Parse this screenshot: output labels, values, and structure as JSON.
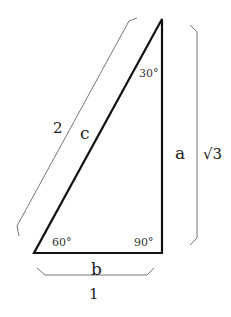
{
  "diagram": {
    "vertices": {
      "top": {
        "x": 162,
        "y": 19
      },
      "bottom_left": {
        "x": 34,
        "y": 253
      },
      "bottom_right": {
        "x": 162,
        "y": 253
      }
    },
    "sides": {
      "hypotenuse": {
        "label": "c",
        "length": "2"
      },
      "vertical": {
        "label": "a",
        "length": "√3"
      },
      "base": {
        "label": "b",
        "length": "1"
      }
    },
    "angles": {
      "top": "30°",
      "bottom_left": "60°",
      "bottom_right": "90°"
    },
    "colors": {
      "triangle_stroke": "#111111",
      "bracket_stroke": "#777777"
    }
  }
}
